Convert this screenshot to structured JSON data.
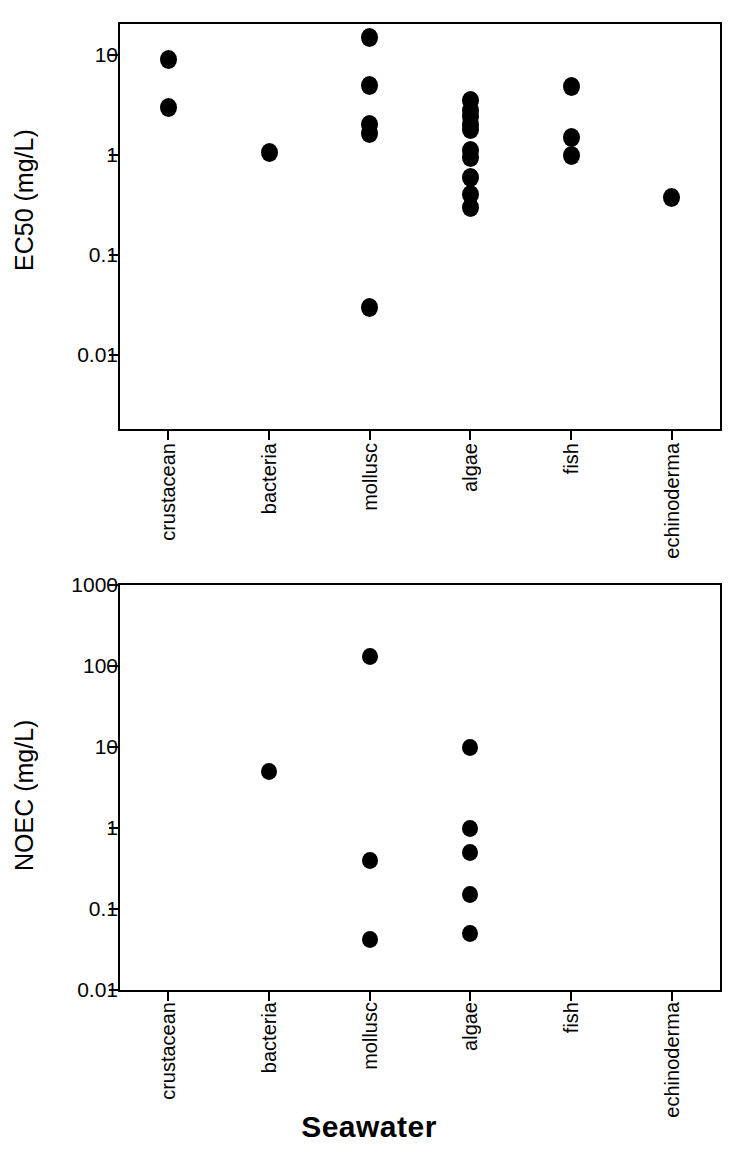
{
  "figure": {
    "title": "Seawater",
    "categories": [
      "crustacean",
      "bacteria",
      "mollusc",
      "algae",
      "fish",
      "echinoderma"
    ]
  },
  "chart_data": [
    {
      "type": "scatter",
      "panel": "top",
      "title": "",
      "xlabel": "Seawater",
      "ylabel": "EC50 (mg/L)",
      "yscale": "log",
      "ylim": [
        0.003,
        20
      ],
      "ytick_labels": [
        "10",
        "1",
        "0.1",
        "0.01"
      ],
      "ytick_values": [
        10,
        1,
        0.1,
        0.01
      ],
      "grid": false,
      "legend": "none",
      "categories": [
        "crustacean",
        "bacteria",
        "mollusc",
        "algae",
        "fish",
        "echinoderma"
      ],
      "series": [
        {
          "name": "crustacean",
          "values": [
            9.0,
            3.0
          ]
        },
        {
          "name": "bacteria",
          "values": [
            1.05
          ]
        },
        {
          "name": "mollusc",
          "values": [
            15.0,
            4.9,
            2.0,
            1.65,
            0.03
          ]
        },
        {
          "name": "algae",
          "values": [
            3.5,
            2.8,
            2.4,
            2.0,
            1.8,
            1.1,
            0.95,
            0.6,
            0.4,
            0.3
          ]
        },
        {
          "name": "fish",
          "values": [
            4.8,
            1.5,
            1.0
          ]
        },
        {
          "name": "echinoderma",
          "values": [
            0.38
          ]
        }
      ]
    },
    {
      "type": "scatter",
      "panel": "bottom",
      "title": "",
      "xlabel": "Seawater",
      "ylabel": "NOEC (mg/L)",
      "yscale": "log",
      "ylim": [
        0.01,
        1000
      ],
      "ytick_labels": [
        "1000",
        "100",
        "10",
        "1",
        "0.1",
        "0.01"
      ],
      "ytick_values": [
        1000,
        100,
        10,
        1,
        0.1,
        0.01
      ],
      "grid": false,
      "legend": "none",
      "categories": [
        "crustacean",
        "bacteria",
        "mollusc",
        "algae",
        "fish",
        "echinoderma"
      ],
      "series": [
        {
          "name": "crustacean",
          "values": []
        },
        {
          "name": "bacteria",
          "values": [
            5.0
          ]
        },
        {
          "name": "mollusc",
          "values": [
            130.0,
            0.4,
            0.042
          ]
        },
        {
          "name": "algae",
          "values": [
            10.0,
            1.0,
            0.5,
            0.15,
            0.05
          ]
        },
        {
          "name": "fish",
          "values": []
        },
        {
          "name": "echinoderma",
          "values": []
        }
      ]
    }
  ]
}
